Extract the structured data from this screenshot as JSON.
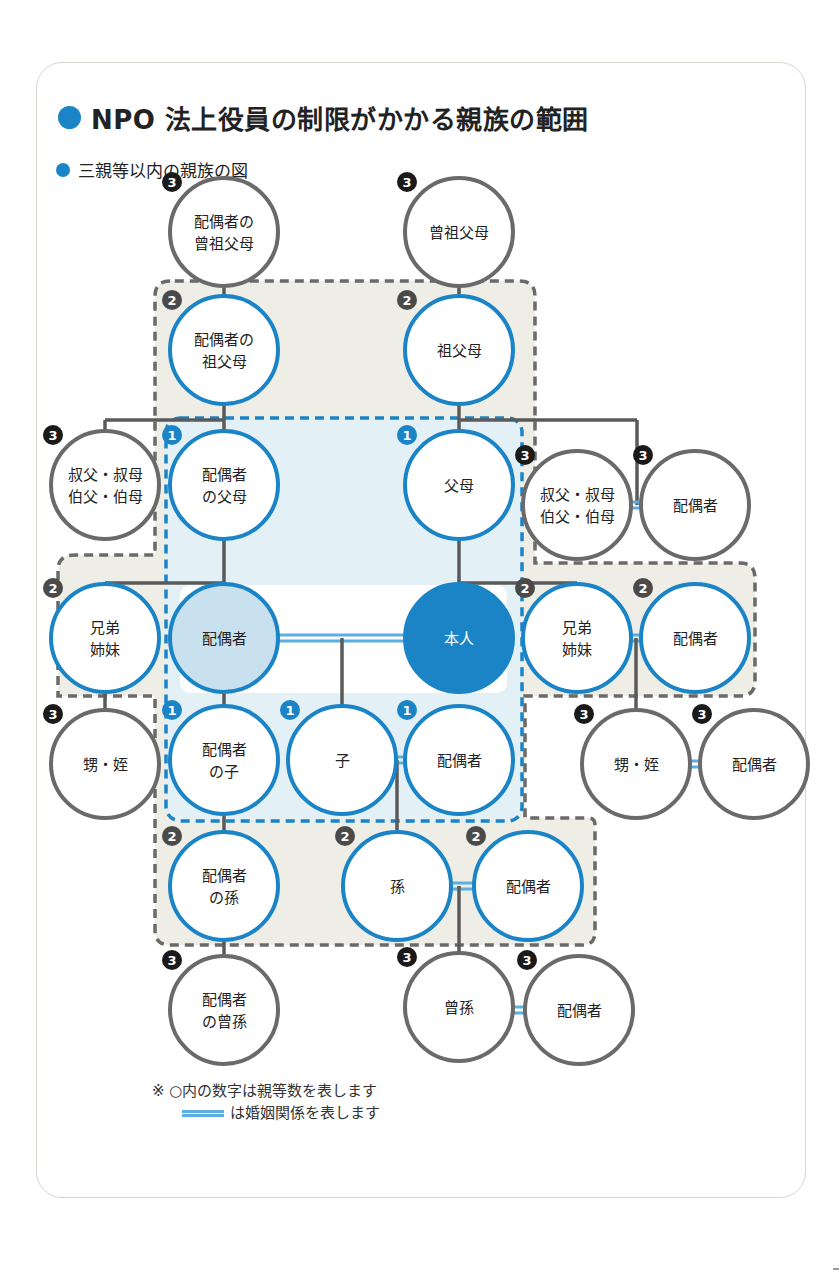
{
  "header": {
    "title": "NPO 法上役員の制限がかかる親族の範囲",
    "subtitle": "三親等以内の親族の図"
  },
  "colors": {
    "accent_blue": "#1a84c6",
    "marriage_line": "#5aaee0",
    "line_gray": "#5a5a5a",
    "degree2_zone_fill": "#eeede6",
    "degree1_zone_fill": "#e3f1f7",
    "self_fill": "#1a84c6",
    "spouse_fill": "#c9e1ef"
  },
  "nodes": [
    {
      "id": "spouse-great-grandparents",
      "lines": [
        "配偶者の",
        "曾祖父母"
      ],
      "degree": 3,
      "x": 224,
      "y": 232
    },
    {
      "id": "great-grandparents",
      "lines": [
        "曾祖父母"
      ],
      "degree": 3,
      "x": 459,
      "y": 232
    },
    {
      "id": "spouse-grandparents",
      "lines": [
        "配偶者の",
        "祖父母"
      ],
      "degree": 2,
      "x": 224,
      "y": 350
    },
    {
      "id": "grandparents",
      "lines": [
        "祖父母"
      ],
      "degree": 2,
      "x": 459,
      "y": 350
    },
    {
      "id": "uncle-aunt-left",
      "lines": [
        "叔父・叔母",
        "伯父・伯母"
      ],
      "degree": 3,
      "x": 105,
      "y": 485
    },
    {
      "id": "spouse-parents",
      "lines": [
        "配偶者",
        "の父母"
      ],
      "degree": 1,
      "x": 224,
      "y": 485
    },
    {
      "id": "parents",
      "lines": [
        "父母"
      ],
      "degree": 1,
      "x": 459,
      "y": 485
    },
    {
      "id": "uncle-aunt-right",
      "lines": [
        "叔父・叔母",
        "伯父・伯母"
      ],
      "degree": 3,
      "x": 577,
      "y": 505
    },
    {
      "id": "uncle-aunt-right-spouse",
      "lines": [
        "配偶者"
      ],
      "degree": 3,
      "x": 695,
      "y": 505
    },
    {
      "id": "siblings-left",
      "lines": [
        "兄弟",
        "姉妹"
      ],
      "degree": 2,
      "x": 105,
      "y": 638
    },
    {
      "id": "spouse",
      "lines": [
        "配偶者"
      ],
      "degree": 0,
      "x": 224,
      "y": 638
    },
    {
      "id": "self",
      "lines": [
        "本人"
      ],
      "degree": 0,
      "x": 459,
      "y": 638
    },
    {
      "id": "siblings-right",
      "lines": [
        "兄弟",
        "姉妹"
      ],
      "degree": 2,
      "x": 577,
      "y": 638
    },
    {
      "id": "sibling-right-spouse",
      "lines": [
        "配偶者"
      ],
      "degree": 2,
      "x": 695,
      "y": 638
    },
    {
      "id": "nephew-niece-left",
      "lines": [
        "甥・姪"
      ],
      "degree": 3,
      "x": 105,
      "y": 764
    },
    {
      "id": "spouse-child",
      "lines": [
        "配偶者",
        "の子"
      ],
      "degree": 1,
      "x": 224,
      "y": 760
    },
    {
      "id": "child",
      "lines": [
        "子"
      ],
      "degree": 1,
      "x": 342,
      "y": 760
    },
    {
      "id": "child-spouse",
      "lines": [
        "配偶者"
      ],
      "degree": 1,
      "x": 459,
      "y": 760
    },
    {
      "id": "nephew-niece-right",
      "lines": [
        "甥・姪"
      ],
      "degree": 3,
      "x": 636,
      "y": 764
    },
    {
      "id": "nephew-niece-right-spouse",
      "lines": [
        "配偶者"
      ],
      "degree": 3,
      "x": 754,
      "y": 764
    },
    {
      "id": "spouse-grandchild",
      "lines": [
        "配偶者",
        "の孫"
      ],
      "degree": 2,
      "x": 224,
      "y": 886
    },
    {
      "id": "grandchild",
      "lines": [
        "孫"
      ],
      "degree": 2,
      "x": 397,
      "y": 886
    },
    {
      "id": "grandchild-spouse",
      "lines": [
        "配偶者"
      ],
      "degree": 2,
      "x": 528,
      "y": 886
    },
    {
      "id": "spouse-great-grandchild",
      "lines": [
        "配偶者",
        "の曾孫"
      ],
      "degree": 3,
      "x": 224,
      "y": 1010
    },
    {
      "id": "great-grandchild",
      "lines": [
        "曾孫"
      ],
      "degree": 3,
      "x": 459,
      "y": 1007
    },
    {
      "id": "great-grandchild-spouse",
      "lines": [
        "配偶者"
      ],
      "degree": 3,
      "x": 579,
      "y": 1010
    }
  ],
  "degree_badges": {
    "1": "1",
    "2": "2",
    "3": "3"
  },
  "legend": {
    "note1": "※ ○内の数字は親等数を表します",
    "note2": "は婚姻関係を表します"
  }
}
